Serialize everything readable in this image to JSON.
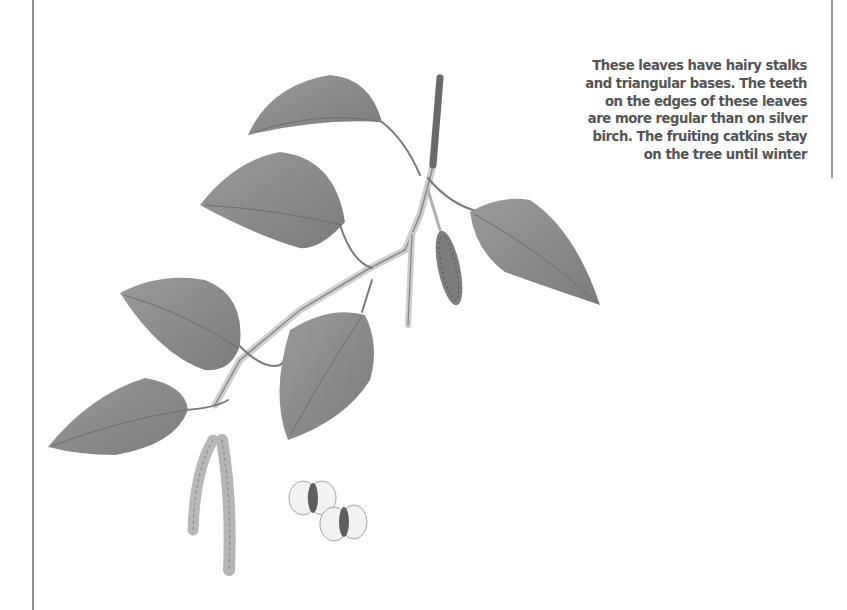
{
  "page": {
    "background": "#ffffff",
    "rule_color": "#8f8f8f"
  },
  "caption": {
    "lines": [
      "These leaves have hairy stalks",
      "and triangular bases. The teeth",
      "on the edges of these leaves",
      "are more regular than on silver",
      "birch. The fruiting catkins stay",
      "on the tree until winter"
    ],
    "color": "#545454"
  },
  "illustration": {
    "subject": "birch twig with leaves, catkins and winged seeds",
    "leaf_color": "#8a8a8a",
    "stem_color": "#6a6a6a",
    "parts": [
      "leaf",
      "leaf",
      "leaf",
      "leaf",
      "leaf",
      "leaf",
      "leaf",
      "fruiting-catkin",
      "male-catkin",
      "male-catkin",
      "winged-seed",
      "winged-seed"
    ]
  }
}
